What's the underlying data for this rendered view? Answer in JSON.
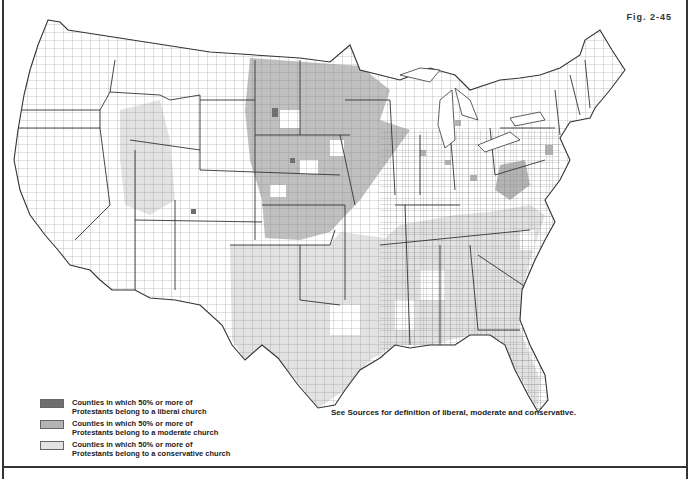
{
  "figure": {
    "label": "Fig. 2-45"
  },
  "caption": "See Sources for definition of liberal, moderate and conservative.",
  "legend": {
    "items": [
      {
        "key": "liberal",
        "line1": "Counties in which 50% or more of",
        "line2": "Protestants belong to a liberal church",
        "color": "#6e6e6e"
      },
      {
        "key": "moderate",
        "line1": "Counties in which 50% or more of",
        "line2": "Protestants belong to a moderate church",
        "color": "#b4b4b4"
      },
      {
        "key": "conservative",
        "line1": "Counties in which 50% or more of",
        "line2": "Protestants belong to a conservative church",
        "color": "#e2e2e2"
      }
    ]
  },
  "map": {
    "subject": "Contiguous United States county-level Protestant denominational affiliation",
    "regions_moderate": [
      "Northern Great Plains",
      "Upper Midwest",
      "Kansas/Nebraska",
      "West Virginia"
    ],
    "regions_conservative": [
      "Texas",
      "Oklahoma",
      "Arkansas",
      "Tennessee",
      "Kentucky",
      "Georgia",
      "Alabama",
      "Mississippi",
      "Utah/Idaho"
    ],
    "colors": {
      "border": "#333333",
      "county_line": "#777777",
      "unshaded": "#ffffff"
    }
  }
}
